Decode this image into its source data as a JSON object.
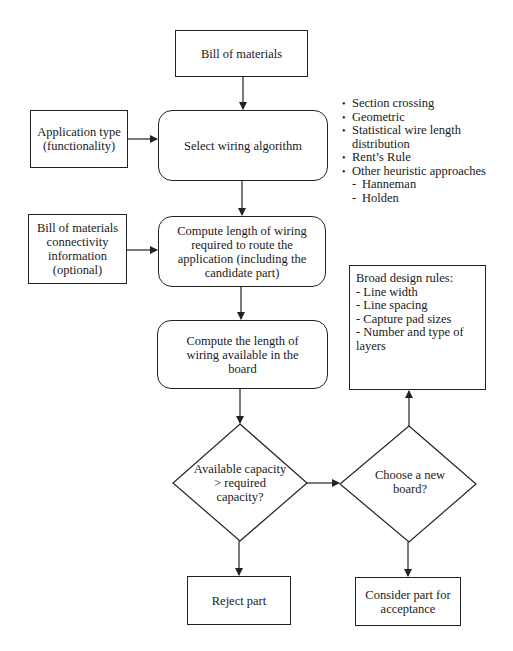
{
  "diagram": {
    "nodes": {
      "bill_of_materials": "Bill of materials",
      "application_type": [
        "Application type",
        "(functionality)"
      ],
      "select_wiring_algorithm": "Select wiring algorithm",
      "bom_connectivity": [
        "Bill of materials",
        "connectivity",
        "information",
        "(optional)"
      ],
      "compute_required": [
        "Compute length of wiring",
        "required to route the",
        "application (including the",
        "candidate part)"
      ],
      "compute_available": [
        "Compute the length of",
        "wiring available in the",
        "board"
      ],
      "decision_capacity": [
        "Available",
        "capacity >",
        "required",
        "capacity?"
      ],
      "decision_new_board": [
        "Choose a new",
        "board?"
      ],
      "reject_part": "Reject part",
      "consider_part": [
        "Consider part for",
        "acceptance"
      ]
    },
    "algorithms": {
      "items": [
        "Section crossing",
        "Geometric",
        "Statistical wire length",
        "distribution",
        "Rent’s Rule",
        "Other heuristic approaches"
      ],
      "sub_items": [
        "Hanneman",
        "Holden"
      ]
    },
    "design_rules": {
      "title": "Broad design rules:",
      "items": [
        "- Line width",
        "- Line spacing",
        "- Capture pad sizes",
        "- Number and type of",
        "  layers"
      ]
    },
    "colors": {
      "stroke": "#222222",
      "background": "#ffffff",
      "text": "#1a1a1a"
    }
  }
}
